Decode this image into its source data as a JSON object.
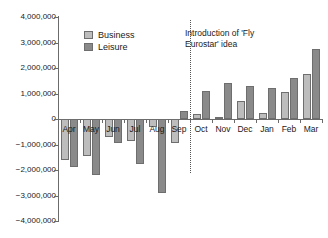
{
  "chart_data": {
    "type": "bar",
    "title": "",
    "xlabel": "",
    "ylabel": "",
    "ylim": [
      -4000000,
      4000000
    ],
    "grid": false,
    "legend_position": "top-left-inside",
    "categories": [
      "Apr",
      "May",
      "Jun",
      "Jul",
      "Aug",
      "Sep",
      "Oct",
      "Nov",
      "Dec",
      "Jan",
      "Feb",
      "Mar"
    ],
    "y_ticks": [
      "4,000,000",
      "3,000,000",
      "2,000,000",
      "1,000,000",
      "0",
      "-1,000,000",
      "-2,000,000",
      "-3,000,000",
      "-4,000,000"
    ],
    "y_tick_values": [
      4000000,
      3000000,
      2000000,
      1000000,
      0,
      -1000000,
      -2000000,
      -3000000,
      -4000000
    ],
    "series": [
      {
        "name": "Business",
        "color": "#bdbdbd",
        "values": [
          -1600000,
          -1450000,
          -700000,
          -850000,
          -300000,
          -950000,
          200000,
          60000,
          700000,
          250000,
          1050000,
          1750000
        ]
      },
      {
        "name": "Leisure",
        "color": "#8a8a8a",
        "values": [
          -1900000,
          -2200000,
          -950000,
          -1750000,
          -2900000,
          320000,
          1100000,
          1400000,
          1300000,
          1200000,
          1600000,
          2750000
        ]
      }
    ],
    "annotations": [
      {
        "text": "Introduction of 'Fly\nEurostar' idea",
        "at_category": "Sep",
        "style": "vertical-dotted-line"
      }
    ]
  },
  "legend": {
    "items": [
      {
        "label": "Business"
      },
      {
        "label": "Leisure"
      }
    ]
  },
  "annotation": {
    "text": "Introduction of 'Fly\nEurostar' idea"
  }
}
